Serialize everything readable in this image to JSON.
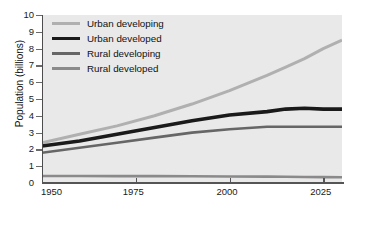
{
  "chart_data": {
    "type": "line",
    "title": "",
    "xlabel": "",
    "ylabel": "Population (billions)",
    "xlim": [
      1950,
      2030
    ],
    "ylim": [
      0,
      10
    ],
    "xticks": [
      1950,
      1975,
      2000,
      2025
    ],
    "yticks": [
      0,
      1,
      2,
      3,
      4,
      5,
      6,
      7,
      8,
      9,
      10
    ],
    "grid": false,
    "legend_position": "top-left",
    "x": [
      1950,
      1960,
      1970,
      1980,
      1990,
      2000,
      2010,
      2015,
      2020,
      2025,
      2030
    ],
    "series": [
      {
        "name": "Urban developing",
        "color": "#b0b0b0",
        "values": [
          2.4,
          2.9,
          3.4,
          4.0,
          4.7,
          5.5,
          6.4,
          6.9,
          7.4,
          8.0,
          8.5
        ]
      },
      {
        "name": "Urban developed",
        "color": "#1a1a1a",
        "values": [
          2.2,
          2.5,
          2.9,
          3.3,
          3.7,
          4.05,
          4.25,
          4.4,
          4.45,
          4.4,
          4.4
        ]
      },
      {
        "name": "Rural developing",
        "color": "#666666",
        "values": [
          1.8,
          2.1,
          2.4,
          2.7,
          3.0,
          3.2,
          3.35,
          3.35,
          3.35,
          3.35,
          3.35
        ]
      },
      {
        "name": "Rural developed",
        "color": "#8a8a8a",
        "values": [
          0.42,
          0.42,
          0.41,
          0.41,
          0.4,
          0.39,
          0.38,
          0.37,
          0.36,
          0.35,
          0.34
        ]
      }
    ]
  },
  "legend": {
    "items": [
      {
        "label": "Urban developing",
        "color": "#b0b0b0"
      },
      {
        "label": "Urban developed",
        "color": "#1a1a1a"
      },
      {
        "label": "Rural developing",
        "color": "#666666"
      },
      {
        "label": "Rural developed",
        "color": "#8a8a8a"
      }
    ]
  },
  "axes": {
    "y_label": "Population (billions)",
    "y_ticks": [
      "10",
      "9",
      "8",
      "7",
      "6",
      "5",
      "4",
      "3",
      "2",
      "1",
      "0"
    ],
    "x_ticks": [
      "1950",
      "1975",
      "2000",
      "2025"
    ]
  },
  "colors": {
    "plot_background": "#e9e9e9",
    "page_background": "#ffffff",
    "axis": "#555555",
    "text": "#111111"
  }
}
